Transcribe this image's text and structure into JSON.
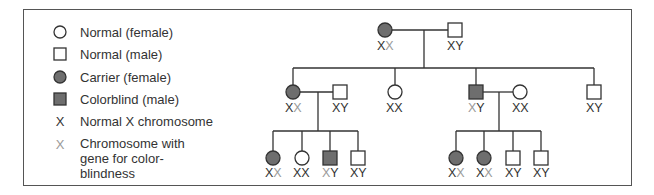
{
  "colors": {
    "line": "#333333",
    "affected_fill": "#6e6e6e",
    "normal_x": "#333333",
    "cb_x": "#9a9a9a"
  },
  "legend": [
    {
      "icon": "open-circle-icon",
      "label": "Normal (female)"
    },
    {
      "icon": "open-square-icon",
      "label": "Normal (male)"
    },
    {
      "icon": "filled-circle-icon",
      "label": "Carrier (female)"
    },
    {
      "icon": "filled-square-icon",
      "label": "Colorblind (male)"
    },
    {
      "icon": "x-normal-icon",
      "glyph": "X",
      "label": "Normal X chromosome"
    },
    {
      "icon": "x-colorblind-icon",
      "glyph": "X",
      "label_lines": [
        "Chromosome with",
        "gene for color-",
        "blindness"
      ]
    }
  ],
  "pedigree": {
    "generation_1": [
      {
        "sex": "female",
        "status": "carrier",
        "genotype": [
          "X",
          "X*"
        ]
      },
      {
        "sex": "male",
        "status": "normal",
        "genotype": [
          "X",
          "Y"
        ]
      }
    ],
    "generation_2": [
      {
        "sex": "female",
        "status": "carrier",
        "genotype": [
          "X",
          "X*"
        ],
        "spouse": {
          "sex": "male",
          "status": "normal",
          "genotype": [
            "X",
            "Y"
          ]
        }
      },
      {
        "sex": "female",
        "status": "normal",
        "genotype": [
          "X",
          "X"
        ]
      },
      {
        "sex": "male",
        "status": "colorblind",
        "genotype": [
          "X*",
          "Y"
        ],
        "spouse": {
          "sex": "female",
          "status": "normal",
          "genotype": [
            "X",
            "X"
          ]
        }
      },
      {
        "sex": "male",
        "status": "normal",
        "genotype": [
          "X",
          "Y"
        ]
      }
    ],
    "generation_3_left": [
      {
        "sex": "female",
        "status": "carrier",
        "genotype": [
          "X",
          "X*"
        ]
      },
      {
        "sex": "female",
        "status": "normal",
        "genotype": [
          "X",
          "X"
        ]
      },
      {
        "sex": "male",
        "status": "colorblind",
        "genotype": [
          "X*",
          "Y"
        ]
      },
      {
        "sex": "male",
        "status": "normal",
        "genotype": [
          "X",
          "Y"
        ]
      }
    ],
    "generation_3_right": [
      {
        "sex": "female",
        "status": "carrier",
        "genotype": [
          "X",
          "X*"
        ]
      },
      {
        "sex": "female",
        "status": "carrier",
        "genotype": [
          "X",
          "X*"
        ]
      },
      {
        "sex": "male",
        "status": "normal",
        "genotype": [
          "X",
          "Y"
        ]
      },
      {
        "sex": "male",
        "status": "normal",
        "genotype": [
          "X",
          "Y"
        ]
      }
    ]
  },
  "labels": {
    "g1_mother": [
      "X",
      "X"
    ],
    "g1_father": [
      "X",
      "Y"
    ],
    "g2_a": [
      "X",
      "X"
    ],
    "g2_a_spouse": [
      "X",
      "Y"
    ],
    "g2_b": [
      "X",
      "X"
    ],
    "g2_c": [
      "X",
      "Y"
    ],
    "g2_c_spouse": [
      "X",
      "X"
    ],
    "g2_d": [
      "X",
      "Y"
    ],
    "g3l_1": [
      "X",
      "X"
    ],
    "g3l_2": [
      "X",
      "X"
    ],
    "g3l_3": [
      "X",
      "Y"
    ],
    "g3l_4": [
      "X",
      "Y"
    ],
    "g3r_1": [
      "X",
      "X"
    ],
    "g3r_2": [
      "X",
      "X"
    ],
    "g3r_3": [
      "X",
      "Y"
    ],
    "g3r_4": [
      "X",
      "Y"
    ]
  }
}
